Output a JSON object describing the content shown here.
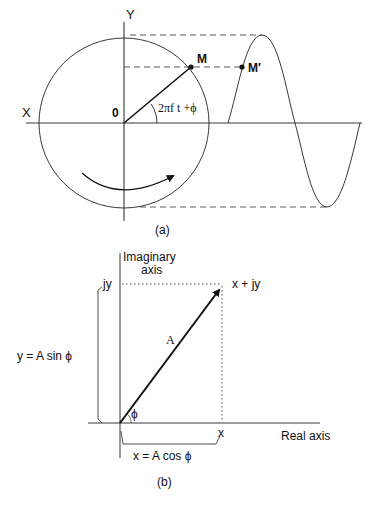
{
  "figure_a": {
    "caption": "(a)",
    "axis_x_label": "X",
    "axis_y_label": "Y",
    "origin_label": "0",
    "point_m_label": "M",
    "point_m_prime_label": "M′",
    "angle_label": "2πf t +ϕ",
    "rotation_direction": "counterclockwise-arrow"
  },
  "figure_b": {
    "caption": "(b)",
    "imag_axis_label_line1": "Imaginary",
    "imag_axis_label_line2": "axis",
    "real_axis_label": "Real  axis",
    "jy_label": "jy",
    "x_label": "x",
    "point_label": "x  +  jy",
    "vector_label": "A",
    "angle_label": "ϕ",
    "y_formula": "y  =  A  sin ϕ",
    "x_formula": "x  =  A  cos ϕ"
  },
  "colors": {
    "ink": "#111111",
    "background": "#ffffff"
  }
}
